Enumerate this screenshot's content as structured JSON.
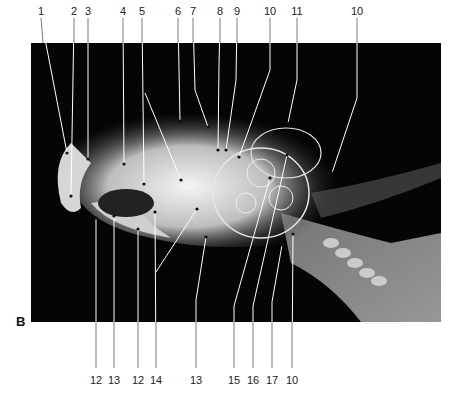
{
  "figure": {
    "panel_label": "B",
    "image_description": "Lateral radiograph of a parrot (psittacine) skull and cervical region with numbered anatomical callouts",
    "top_labels": [
      {
        "text": "1",
        "x": 41
      },
      {
        "text": "2",
        "x": 74
      },
      {
        "text": "3",
        "x": 88
      },
      {
        "text": "4",
        "x": 123
      },
      {
        "text": "5",
        "x": 142
      },
      {
        "text": "6",
        "x": 178
      },
      {
        "text": "7",
        "x": 193
      },
      {
        "text": "8",
        "x": 220
      },
      {
        "text": "9",
        "x": 237
      },
      {
        "text": "10",
        "x": 270
      },
      {
        "text": "11",
        "x": 297
      },
      {
        "text": "10",
        "x": 357
      }
    ],
    "bottom_labels": [
      {
        "text": "12",
        "x": 96
      },
      {
        "text": "13",
        "x": 114
      },
      {
        "text": "12",
        "x": 138
      },
      {
        "text": "14",
        "x": 156
      },
      {
        "text": "13",
        "x": 196
      },
      {
        "text": "15",
        "x": 234
      },
      {
        "text": "16",
        "x": 253
      },
      {
        "text": "17",
        "x": 272
      },
      {
        "text": "10",
        "x": 292
      }
    ]
  }
}
